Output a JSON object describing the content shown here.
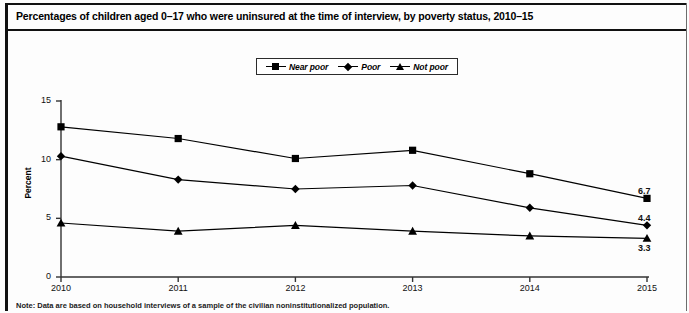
{
  "title": "Percentages of children aged 0–17 who were uninsured at the time of interview, by poverty status, 2010–15",
  "note": "Note: Data are based on household interviews of a sample of the civilian noninstitutionalized population.",
  "legend": {
    "items": [
      {
        "label": "Near poor",
        "marker": "square-marker"
      },
      {
        "label": "Poor",
        "marker": "diamond-marker"
      },
      {
        "label": "Not poor",
        "marker": "triangle-marker"
      }
    ]
  },
  "axes": {
    "ylabel": "Percent",
    "yticks": [
      "0",
      "5",
      "10",
      "15"
    ],
    "xticks": [
      "2010",
      "2011",
      "2012",
      "2013",
      "2014",
      "2015"
    ]
  },
  "end_labels": {
    "near_poor": "6.7",
    "poor": "4.4",
    "not_poor": "3.3"
  },
  "colors": {
    "line": "#000000",
    "frame": "#111111",
    "background": "#ffffff"
  },
  "chart_data": {
    "type": "line",
    "title": "Percentages of children aged 0–17 who were uninsured at the time of interview, by poverty status, 2010–15",
    "xlabel": "",
    "ylabel": "Percent",
    "x": [
      "2010",
      "2011",
      "2012",
      "2013",
      "2014",
      "2015"
    ],
    "ylim": [
      0,
      15
    ],
    "yticks": [
      0,
      5,
      10,
      15
    ],
    "grid": false,
    "legend_position": "top-center",
    "series": [
      {
        "name": "Near poor",
        "marker": "square",
        "values": [
          12.8,
          11.8,
          10.1,
          10.8,
          8.8,
          6.7
        ],
        "end_label": "6.7"
      },
      {
        "name": "Poor",
        "marker": "diamond",
        "values": [
          10.3,
          8.3,
          7.5,
          7.8,
          5.9,
          4.4
        ],
        "end_label": "4.4"
      },
      {
        "name": "Not poor",
        "marker": "triangle",
        "values": [
          4.6,
          3.9,
          4.4,
          3.9,
          3.5,
          3.3
        ],
        "end_label": "3.3"
      }
    ]
  }
}
